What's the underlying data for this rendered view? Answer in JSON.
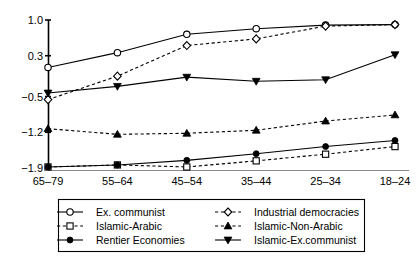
{
  "chart_data": {
    "type": "line",
    "title": "",
    "xlabel": "",
    "ylabel": "",
    "categories": [
      "65–79",
      "55–64",
      "45–54",
      "35–44",
      "25–34",
      "18–24"
    ],
    "yticks": [
      "1.0",
      "0.3",
      "-0.5",
      "-1.2",
      "-1.9"
    ],
    "ytick_values": [
      1.0,
      0.3,
      -0.5,
      -1.2,
      -1.9
    ],
    "ylim": [
      -1.9,
      1.0
    ],
    "grid": false,
    "legend_position": "bottom",
    "series": [
      {
        "name": "Ex. communist",
        "line": "solid",
        "marker": "circle-open",
        "values": [
          0.07,
          0.36,
          0.72,
          0.83,
          0.9,
          0.91
        ]
      },
      {
        "name": "Industrial democracies",
        "line": "dashed",
        "marker": "diamond-open",
        "values": [
          -0.56,
          -0.1,
          0.5,
          0.63,
          0.88,
          0.91
        ]
      },
      {
        "name": "Islamic-Arabic",
        "line": "dashed",
        "marker": "square-open",
        "values": [
          -1.88,
          -1.84,
          -1.88,
          -1.76,
          -1.63,
          -1.48
        ]
      },
      {
        "name": "Islamic-Non-Arabic",
        "line": "dashed",
        "marker": "triangle-up-filled",
        "values": [
          -1.13,
          -1.24,
          -1.22,
          -1.16,
          -0.98,
          -0.86
        ]
      },
      {
        "name": "Rentier Economies",
        "line": "solid",
        "marker": "circle-filled",
        "values": [
          -1.88,
          -1.84,
          -1.75,
          -1.62,
          -1.48,
          -1.36
        ]
      },
      {
        "name": "Islamic-Ex.communist",
        "line": "solid",
        "marker": "triangle-down-filled",
        "values": [
          -0.43,
          -0.3,
          -0.12,
          -0.2,
          -0.17,
          0.32
        ]
      }
    ],
    "legend_entries": [
      {
        "label": "Ex. communist",
        "line": "solid",
        "marker": "circle-open"
      },
      {
        "label": "Industrial democracies",
        "line": "dashed",
        "marker": "diamond-open"
      },
      {
        "label": "Islamic-Arabic",
        "line": "dashed",
        "marker": "square-open"
      },
      {
        "label": "Islamic-Non-Arabic",
        "line": "dashed",
        "marker": "triangle-up-filled"
      },
      {
        "label": "Rentier Economies",
        "line": "solid",
        "marker": "circle-filled"
      },
      {
        "label": "Islamic-Ex.communist",
        "line": "solid",
        "marker": "triangle-down-filled"
      }
    ]
  }
}
